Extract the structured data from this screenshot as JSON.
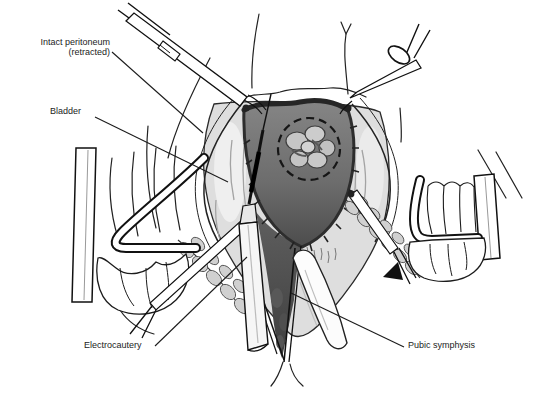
{
  "figure": {
    "kind": "surgical-line-illustration",
    "colors": {
      "background": "#ffffff",
      "ink": "#1c1c1c",
      "deep_shade": "#4a4a4a",
      "mid_shade": "#7e7e7e",
      "tissue_light": "#dedede",
      "muscle_gray": "#d0d0d0"
    }
  },
  "annotations": {
    "intact_peritoneum": {
      "line1": "Intact peritoneum",
      "line2": "(retracted)"
    },
    "bladder": {
      "text": "Bladder"
    },
    "electrocautery": {
      "text": "Electrocautery"
    },
    "pubic_symphysis": {
      "text": "Pubic symphysis"
    }
  }
}
